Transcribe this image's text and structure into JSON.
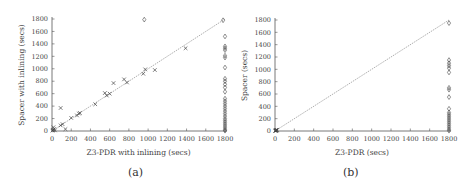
{
  "figures": [
    {
      "caption": "(a)",
      "xlabel": "Z3-PDR with inlining (secs)",
      "ylabel": "Spacer with inlining (secs)"
    },
    {
      "caption": "(b)",
      "xlabel": "Z3-PDR (secs)",
      "ylabel": "Spacer (secs)"
    }
  ],
  "chart_data": [
    {
      "type": "scatter",
      "title": "",
      "caption": "(a)",
      "xlabel": "Z3-PDR with inlining (secs)",
      "ylabel": "SPACER with inlining (secs)",
      "xlim": [
        0,
        1800
      ],
      "ylim": [
        0,
        1800
      ],
      "xticks": [
        0,
        200,
        400,
        600,
        800,
        1000,
        1200,
        1400,
        1600,
        1800
      ],
      "yticks": [
        0,
        200,
        400,
        600,
        800,
        1000,
        1200,
        1400,
        1600,
        1800
      ],
      "grid": false,
      "diagonal": true,
      "series": [
        {
          "name": "both solved",
          "marker": "x",
          "points": [
            [
              5,
              5
            ],
            [
              10,
              15
            ],
            [
              15,
              60
            ],
            [
              20,
              30
            ],
            [
              30,
              10
            ],
            [
              90,
              370
            ],
            [
              90,
              90
            ],
            [
              110,
              110
            ],
            [
              140,
              30
            ],
            [
              200,
              210
            ],
            [
              260,
              250
            ],
            [
              280,
              280
            ],
            [
              290,
              290
            ],
            [
              450,
              430
            ],
            [
              550,
              610
            ],
            [
              570,
              570
            ],
            [
              600,
              600
            ],
            [
              640,
              770
            ],
            [
              750,
              830
            ],
            [
              780,
              780
            ],
            [
              950,
              920
            ],
            [
              970,
              990
            ],
            [
              1070,
              980
            ],
            [
              1390,
              1330
            ]
          ]
        },
        {
          "name": "timeout",
          "marker": "diamond",
          "points": [
            [
              960,
              1790
            ],
            [
              1780,
              1780
            ],
            [
              1800,
              1520
            ],
            [
              1800,
              1360
            ],
            [
              1800,
              1330
            ],
            [
              1800,
              1300
            ],
            [
              1800,
              1210
            ],
            [
              1800,
              1180
            ],
            [
              1800,
              1020
            ],
            [
              1800,
              840
            ],
            [
              1800,
              800
            ],
            [
              1800,
              750
            ],
            [
              1800,
              700
            ],
            [
              1800,
              630
            ],
            [
              1800,
              520
            ],
            [
              1800,
              480
            ],
            [
              1800,
              440
            ],
            [
              1800,
              400
            ],
            [
              1800,
              360
            ],
            [
              1800,
              320
            ],
            [
              1800,
              280
            ],
            [
              1800,
              240
            ],
            [
              1800,
              200
            ],
            [
              1800,
              170
            ],
            [
              1800,
              140
            ],
            [
              1800,
              110
            ],
            [
              1800,
              80
            ],
            [
              1800,
              50
            ],
            [
              1800,
              20
            ],
            [
              1800,
              5
            ]
          ]
        }
      ]
    },
    {
      "type": "scatter",
      "title": "",
      "caption": "(b)",
      "xlabel": "Z3-PDR (secs)",
      "ylabel": "SPACER (secs)",
      "xlim": [
        0,
        1800
      ],
      "ylim": [
        0,
        1800
      ],
      "xticks": [
        0,
        200,
        400,
        600,
        800,
        1000,
        1200,
        1400,
        1600,
        1800
      ],
      "yticks": [
        0,
        200,
        400,
        600,
        800,
        1000,
        1200,
        1400,
        1600,
        1800
      ],
      "grid": false,
      "diagonal": true,
      "series": [
        {
          "name": "both solved",
          "marker": "x",
          "points": [
            [
              2,
              2
            ],
            [
              5,
              8
            ],
            [
              8,
              4
            ],
            [
              10,
              12
            ],
            [
              12,
              6
            ],
            [
              15,
              15
            ],
            [
              18,
              10
            ],
            [
              20,
              20
            ]
          ]
        },
        {
          "name": "timeout",
          "marker": "diamond",
          "points": [
            [
              1800,
              1750
            ],
            [
              1800,
              1150
            ],
            [
              1800,
              1100
            ],
            [
              1800,
              1060
            ],
            [
              1800,
              1020
            ],
            [
              1800,
              950
            ],
            [
              1800,
              700
            ],
            [
              1800,
              670
            ],
            [
              1800,
              550
            ],
            [
              1800,
              360
            ],
            [
              1800,
              300
            ],
            [
              1800,
              270
            ],
            [
              1800,
              240
            ],
            [
              1800,
              210
            ],
            [
              1800,
              180
            ],
            [
              1800,
              150
            ],
            [
              1800,
              120
            ],
            [
              1800,
              90
            ],
            [
              1800,
              60
            ],
            [
              1800,
              30
            ],
            [
              1800,
              5
            ]
          ]
        }
      ]
    }
  ]
}
